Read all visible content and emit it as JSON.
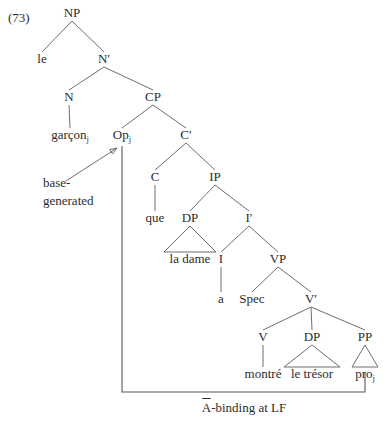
{
  "figure": {
    "example_number": "(73)",
    "caption": "Ā-binding at LF",
    "caption_base": "A",
    "caption_rest": "-binding at LF"
  },
  "annotation": {
    "line1": "base-",
    "line2": "generated"
  },
  "nodes": [
    {
      "id": "NP",
      "label": "NP",
      "sub": "",
      "x": 72,
      "y": 17
    },
    {
      "id": "le",
      "label": "le",
      "sub": "",
      "x": 42,
      "y": 63
    },
    {
      "id": "Nbar",
      "label": "N′",
      "sub": "",
      "x": 104,
      "y": 63
    },
    {
      "id": "N",
      "label": "N",
      "sub": "",
      "x": 69,
      "y": 101
    },
    {
      "id": "CP",
      "label": "CP",
      "sub": "",
      "x": 153,
      "y": 101
    },
    {
      "id": "garcon",
      "label": "garçon",
      "sub": "j",
      "x": 70,
      "y": 139
    },
    {
      "id": "Op",
      "label": "Op",
      "sub": "j",
      "x": 122,
      "y": 139
    },
    {
      "id": "Cbar",
      "label": "C′",
      "sub": "",
      "x": 186,
      "y": 139
    },
    {
      "id": "C",
      "label": "C",
      "sub": "",
      "x": 155,
      "y": 181
    },
    {
      "id": "IP",
      "label": "IP",
      "sub": "",
      "x": 215,
      "y": 181
    },
    {
      "id": "que",
      "label": "que",
      "sub": "",
      "x": 155,
      "y": 222
    },
    {
      "id": "DP1",
      "label": "DP",
      "sub": "",
      "x": 190,
      "y": 222
    },
    {
      "id": "Ibar",
      "label": "I′",
      "sub": "",
      "x": 249,
      "y": 222
    },
    {
      "id": "ladame",
      "label": "la dame",
      "sub": "",
      "x": 190,
      "y": 263
    },
    {
      "id": "I",
      "label": "I",
      "sub": "",
      "x": 221,
      "y": 263
    },
    {
      "id": "VP",
      "label": "VP",
      "sub": "",
      "x": 278,
      "y": 263
    },
    {
      "id": "a",
      "label": "a",
      "sub": "",
      "x": 221,
      "y": 303
    },
    {
      "id": "Spec",
      "label": "Spec",
      "sub": "",
      "x": 252,
      "y": 303
    },
    {
      "id": "Vbar",
      "label": "V′",
      "sub": "",
      "x": 311,
      "y": 303
    },
    {
      "id": "V",
      "label": "V",
      "sub": "",
      "x": 263,
      "y": 341
    },
    {
      "id": "DP2",
      "label": "DP",
      "sub": "",
      "x": 312,
      "y": 341
    },
    {
      "id": "PP",
      "label": "PP",
      "sub": "",
      "x": 365,
      "y": 341
    },
    {
      "id": "montre",
      "label": "montré",
      "sub": "",
      "x": 263,
      "y": 378
    },
    {
      "id": "letresor",
      "label": "le trésor",
      "sub": "",
      "x": 312,
      "y": 378
    },
    {
      "id": "pro",
      "label": "pro",
      "sub": "j",
      "x": 365,
      "y": 378
    }
  ],
  "branches": [
    {
      "from": "NP",
      "to": "le"
    },
    {
      "from": "NP",
      "to": "Nbar"
    },
    {
      "from": "Nbar",
      "to": "N"
    },
    {
      "from": "Nbar",
      "to": "CP"
    },
    {
      "from": "N",
      "to": "garcon"
    },
    {
      "from": "CP",
      "to": "Op"
    },
    {
      "from": "CP",
      "to": "Cbar"
    },
    {
      "from": "Cbar",
      "to": "C"
    },
    {
      "from": "Cbar",
      "to": "IP"
    },
    {
      "from": "C",
      "to": "que"
    },
    {
      "from": "IP",
      "to": "DP1"
    },
    {
      "from": "IP",
      "to": "Ibar"
    },
    {
      "from": "Ibar",
      "to": "I"
    },
    {
      "from": "Ibar",
      "to": "VP"
    },
    {
      "from": "I",
      "to": "a"
    },
    {
      "from": "VP",
      "to": "Spec"
    },
    {
      "from": "VP",
      "to": "Vbar"
    },
    {
      "from": "Vbar",
      "to": "V"
    },
    {
      "from": "Vbar",
      "to": "DP2"
    },
    {
      "from": "Vbar",
      "to": "PP"
    },
    {
      "from": "V",
      "to": "montre"
    }
  ],
  "triangles": [
    {
      "parent": "DP1",
      "terminal": "ladame",
      "half_width": 26
    },
    {
      "parent": "DP2",
      "terminal": "letresor",
      "half_width": 28
    },
    {
      "parent": "PP",
      "terminal": "pro",
      "half_width": 13
    }
  ],
  "binding_path": {
    "start_x": 122,
    "start_y": 146,
    "corner_y": 392,
    "end_x": 365,
    "end_y": 372
  },
  "arrow": {
    "x1": 66,
    "y1": 181,
    "x2": 117,
    "y2": 148
  },
  "colors": {
    "text": "#2b2b2b",
    "branch": "#6e6e6e",
    "index_line": "#595959",
    "background": "#ffffff"
  }
}
